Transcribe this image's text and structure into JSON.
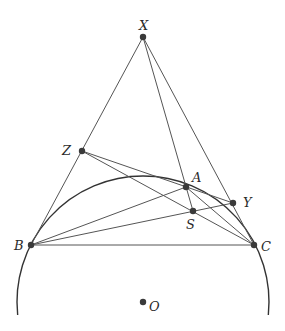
{
  "diagram": {
    "type": "geometry",
    "points": [
      {
        "id": "X",
        "label": "X",
        "x": 143,
        "y": 37,
        "lx": 139,
        "ly": 30
      },
      {
        "id": "Z",
        "label": "Z",
        "x": 82,
        "y": 151,
        "lx": 62,
        "ly": 155
      },
      {
        "id": "A",
        "label": "A",
        "x": 186,
        "y": 187,
        "lx": 192,
        "ly": 182
      },
      {
        "id": "Y",
        "label": "Y",
        "x": 233,
        "y": 203,
        "lx": 243,
        "ly": 207
      },
      {
        "id": "S",
        "label": "S",
        "x": 193,
        "y": 211,
        "lx": 186,
        "ly": 229
      },
      {
        "id": "B",
        "label": "B",
        "x": 31,
        "y": 245,
        "lx": 14,
        "ly": 250
      },
      {
        "id": "C",
        "label": "C",
        "x": 254,
        "y": 245,
        "lx": 261,
        "ly": 251
      },
      {
        "id": "O",
        "label": "O",
        "x": 143,
        "y": 302,
        "lx": 149,
        "ly": 311
      }
    ],
    "segments": [
      [
        "X",
        "B"
      ],
      [
        "X",
        "C"
      ],
      [
        "X",
        "S"
      ],
      [
        "Z",
        "Y"
      ],
      [
        "Z",
        "C"
      ],
      [
        "B",
        "A"
      ],
      [
        "B",
        "Y"
      ],
      [
        "B",
        "C"
      ],
      [
        "A",
        "C"
      ]
    ],
    "circle": {
      "center": "O",
      "cx": 143,
      "cy": 302,
      "r": 126,
      "visible_arc": "upper, from left bottom (17,315) over A to right bottom (270,315)"
    }
  }
}
